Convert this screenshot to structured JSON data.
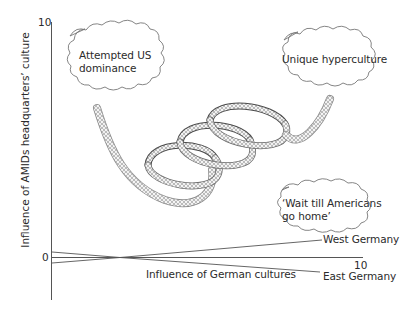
{
  "axes": {
    "y_label": "Influence of AMIDs headquarters’ culture",
    "x_label": "Influence of German cultures",
    "y_max_tick": "10",
    "origin_tick": "0",
    "x_max_tick": "10"
  },
  "clouds": [
    {
      "id": "attempted-us-dominance",
      "line1": "Attempted US",
      "line2": "dominance"
    },
    {
      "id": "unique-hyperculture",
      "line1": "Unique hyperculture"
    },
    {
      "id": "wait-till-americans",
      "line1": "‘Wait till Americans",
      "line2": "go home’"
    }
  ],
  "lines": [
    {
      "label": "West Germany"
    },
    {
      "label": "East Germany"
    }
  ],
  "colors": {
    "axis": "#555555",
    "line": "#555555",
    "spring_light": "#bdbdbd",
    "spring_dark": "#4a4a4a",
    "text": "#2b2b2b"
  }
}
